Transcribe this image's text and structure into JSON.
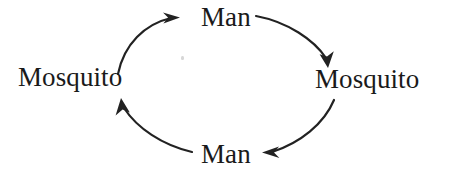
{
  "diagram": {
    "background_color": "#ffffff",
    "stroke_color": "#222222",
    "text_color": "#1a1a1a",
    "nodes": [
      {
        "id": "mosquito-left",
        "label": "Mosquito",
        "position": "left"
      },
      {
        "id": "man-top",
        "label": "Man",
        "position": "top"
      },
      {
        "id": "mosquito-right",
        "label": "Mosquito",
        "position": "right"
      },
      {
        "id": "man-bottom",
        "label": "Man",
        "position": "bottom"
      }
    ],
    "edges": [
      {
        "id": "edge-mosquito-left-to-man-top",
        "from": "Mosquito",
        "to": "Man",
        "direction": "clockwise",
        "arrowhead": "right"
      },
      {
        "id": "edge-man-top-to-mosquito-right",
        "from": "Man",
        "to": "Mosquito",
        "direction": "clockwise",
        "arrowhead": "down"
      },
      {
        "id": "edge-mosquito-right-to-man-bottom",
        "from": "Mosquito",
        "to": "Man",
        "direction": "clockwise",
        "arrowhead": "left"
      },
      {
        "id": "edge-man-bottom-to-mosquito-left",
        "from": "Man",
        "to": "Mosquito",
        "direction": "clockwise",
        "arrowhead": "up"
      }
    ]
  }
}
